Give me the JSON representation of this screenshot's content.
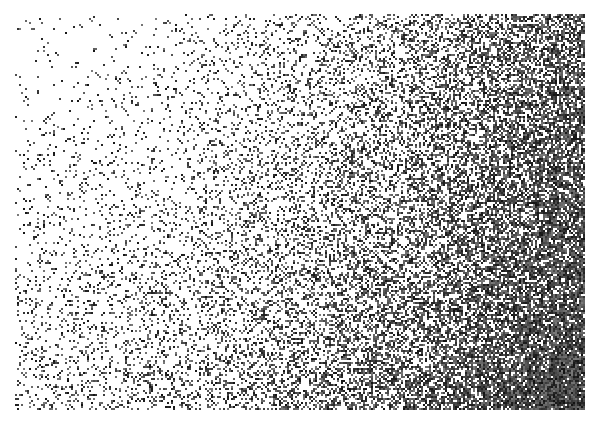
{
  "image": {
    "width": 594,
    "height": 428,
    "background": "#ffffff",
    "description": "Stippled noise gradient: sparse grey-black speckles at top-left densifying to near-solid black at bottom-right"
  },
  "texture": {
    "region": {
      "x": 15,
      "y": 14,
      "width": 570,
      "height": 396
    },
    "ink_color": "#111111",
    "dark_core": {
      "cx": 0.95,
      "cy": 0.95,
      "radius": 0.55
    },
    "density_min": 0.015,
    "density_max": 1.0,
    "seed": 1337
  }
}
